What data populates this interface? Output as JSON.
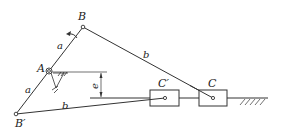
{
  "diagram": {
    "type": "offset slider-crank mechanism (two extreme positions)",
    "points": {
      "A": {
        "label": "A"
      },
      "B": {
        "label": "B"
      },
      "B_prime": {
        "label": "B′"
      },
      "C": {
        "label": "C"
      },
      "C_prime": {
        "label": "C′"
      }
    },
    "links": {
      "crank_AB": {
        "label": "a"
      },
      "crank_AB_prime": {
        "label": "a"
      },
      "rod_BC": {
        "label": "b"
      },
      "rod_B_prime_C_prime": {
        "label": "b"
      }
    },
    "offset": {
      "label": "e"
    },
    "colors": {
      "line": "#333333",
      "background": "#ffffff"
    }
  }
}
